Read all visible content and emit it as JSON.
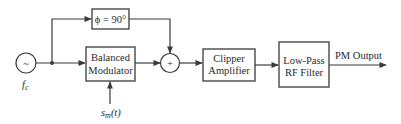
{
  "diagram": {
    "source": {
      "symbol": "~",
      "label": "f",
      "label_sub": "c"
    },
    "phase_shifter": {
      "label": "ϕ = 90°"
    },
    "balanced_modulator": {
      "line1": "Balanced",
      "line2": "Modulator"
    },
    "modulating_input": {
      "label_main": "s",
      "label_sub": "m",
      "label_arg": "(t)"
    },
    "summer": {
      "symbol": "+"
    },
    "clipper": {
      "line1": "Clipper",
      "line2": "Amplifier"
    },
    "filter": {
      "line1": "Low-Pass",
      "line2": "RF Filter"
    },
    "output": {
      "label": "PM Output"
    },
    "colors": {
      "stroke": "#3a3a3a",
      "text": "#2a2a2a",
      "background": "#ffffff"
    }
  }
}
